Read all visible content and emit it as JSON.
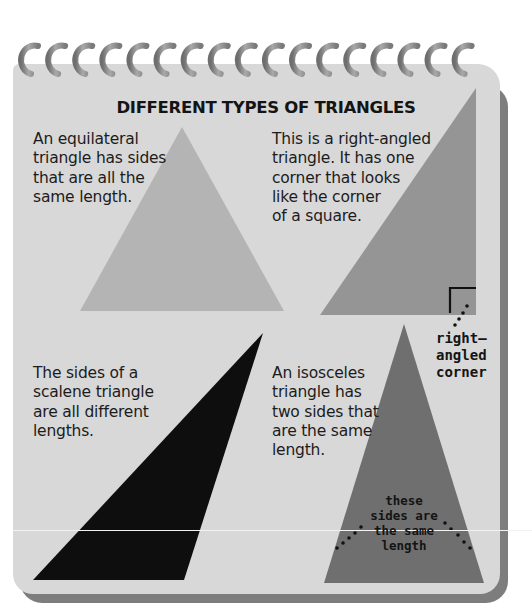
{
  "page": {
    "title": "DIFFERENT TYPES OF TRIANGLES",
    "colors": {
      "page_bg": "#d8d8d8",
      "page_shadow": "#7d7d7d",
      "equilateral_fill": "#b4b4b4",
      "right_angled_fill": "#959595",
      "scalene_fill": "#0e0e0e",
      "isosceles_fill": "#6f6f6f",
      "ring": "#8a8a8a"
    },
    "ring_count": 17
  },
  "sections": {
    "equilateral": {
      "lines": [
        "An equilateral",
        "triangle has sides",
        "that are all the",
        "same length."
      ]
    },
    "right_angled": {
      "lines": [
        "This is a right-angled",
        "triangle. It has one",
        "corner that looks",
        "like the corner",
        "of a square."
      ],
      "callout": [
        "right–",
        "angled",
        "corner"
      ]
    },
    "scalene": {
      "lines": [
        "The sides of a",
        "scalene triangle",
        "are all different",
        "lengths."
      ]
    },
    "isosceles": {
      "lines": [
        "An isosceles",
        "triangle has",
        "two sides that",
        "are the same",
        "length."
      ],
      "callout": [
        "these",
        "sides are",
        "the same",
        "length"
      ]
    }
  }
}
